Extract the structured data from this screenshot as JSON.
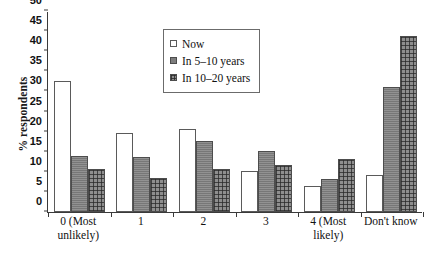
{
  "chart_data": {
    "type": "bar",
    "title": "",
    "xlabel": "",
    "ylabel": "% respondents",
    "ylim": [
      0,
      50
    ],
    "ytick_step": 5,
    "yticks": [
      0,
      5,
      10,
      15,
      20,
      25,
      30,
      35,
      40,
      45,
      50
    ],
    "grid": false,
    "legend_position": "top-center",
    "categories": [
      "0 (Most unlikely)",
      "1",
      "2",
      "3",
      "4 (Most likely)",
      "Don't know"
    ],
    "category_lines": [
      [
        "0 (Most",
        "unlikely)"
      ],
      [
        "1"
      ],
      [
        "2"
      ],
      [
        "3"
      ],
      [
        "4 (Most",
        "likely)"
      ],
      [
        "Don't know"
      ]
    ],
    "series": [
      {
        "name": "Now",
        "fill": "white-outline",
        "values": [
          32.7,
          19.7,
          20.7,
          10.2,
          6.5,
          9.3
        ]
      },
      {
        "name": "In 5–10 years",
        "fill": "solid-gray",
        "values": [
          14.0,
          13.6,
          17.6,
          15.3,
          8.2,
          31.0
        ]
      },
      {
        "name": "In 10–20 years",
        "fill": "grid-hatch-gray",
        "values": [
          10.8,
          8.4,
          10.7,
          11.8,
          13.2,
          43.7
        ]
      }
    ]
  },
  "colors": {
    "axis": "#3a3a3a",
    "text": "#111111",
    "series_now": "#ffffff",
    "series_5_10": "#7d7d7d",
    "series_10_20": "#8e8e8e",
    "background": "#ffffff"
  }
}
